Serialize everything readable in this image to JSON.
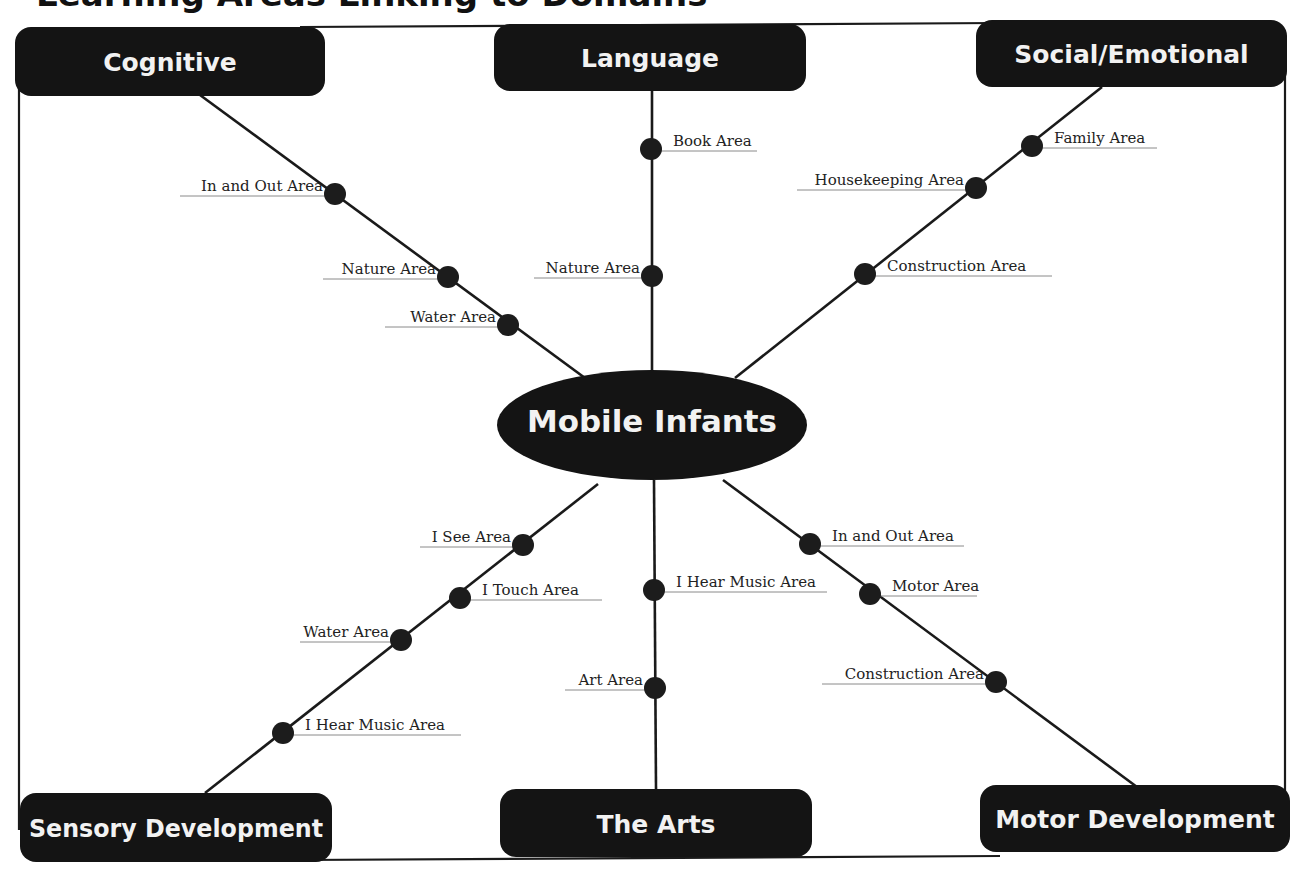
{
  "title_cut_off": "Learning Areas Linking to Domains",
  "hub": {
    "label": "Mobile Infants",
    "cx": 652,
    "cy": 425,
    "rx": 155,
    "ry": 55
  },
  "colors": {
    "box_fill": "#141414",
    "box_text": "#f2f2f2",
    "line": "#1a1a1a",
    "dot": "#1c1c1c",
    "leader": "#8a8a8a"
  },
  "domains": [
    {
      "id": "cognitive",
      "label": "Cognitive",
      "box": [
        15,
        27,
        310,
        69
      ],
      "spoke": [
        [
          200,
          95
        ],
        [
          585,
          378
        ]
      ],
      "areas": [
        {
          "label": "In and Out Area",
          "dot": [
            335,
            194
          ],
          "side": "left",
          "leader_x": 180
        },
        {
          "label": "Nature Area",
          "dot": [
            448,
            277
          ],
          "side": "left",
          "leader_x": 323
        },
        {
          "label": "Water Area",
          "dot": [
            508,
            325
          ],
          "side": "left",
          "leader_x": 385
        }
      ]
    },
    {
      "id": "language",
      "label": "Language",
      "box": [
        494,
        24,
        312,
        67
      ],
      "spoke": [
        [
          652,
          91
        ],
        [
          652,
          371
        ]
      ],
      "areas": [
        {
          "label": "Book Area",
          "dot": [
            651,
            149
          ],
          "side": "right",
          "leader_x": 757
        },
        {
          "label": "Nature Area",
          "dot": [
            652,
            276
          ],
          "side": "left",
          "leader_x": 534
        }
      ]
    },
    {
      "id": "social",
      "label": "Social/Emotional",
      "box": [
        976,
        20,
        311,
        67
      ],
      "spoke": [
        [
          1102,
          87
        ],
        [
          735,
          378
        ]
      ],
      "areas": [
        {
          "label": "Family Area",
          "dot": [
            1032,
            146
          ],
          "side": "right",
          "leader_x": 1157
        },
        {
          "label": "Housekeeping Area",
          "dot": [
            976,
            188
          ],
          "side": "left",
          "leader_x": 797
        },
        {
          "label": "Construction Area",
          "dot": [
            865,
            274
          ],
          "side": "right",
          "leader_x": 1052
        }
      ]
    },
    {
      "id": "sensory",
      "label": "Sensory Development",
      "box": [
        20,
        793,
        312,
        69
      ],
      "spoke": [
        [
          598,
          484
        ],
        [
          205,
          793
        ]
      ],
      "areas": [
        {
          "label": "I See Area",
          "dot": [
            523,
            545
          ],
          "side": "left",
          "leader_x": 420
        },
        {
          "label": "I Touch Area",
          "dot": [
            460,
            598
          ],
          "side": "right",
          "leader_x": 602
        },
        {
          "label": "Water Area",
          "dot": [
            401,
            640
          ],
          "side": "left",
          "leader_x": 300
        },
        {
          "label": "I Hear Music Area",
          "dot": [
            283,
            733
          ],
          "side": "right",
          "leader_x": 461
        }
      ]
    },
    {
      "id": "arts",
      "label": "The Arts",
      "box": [
        500,
        789,
        312,
        68
      ],
      "spoke": [
        [
          654,
          480
        ],
        [
          656,
          789
        ]
      ],
      "areas": [
        {
          "label": "I Hear Music Area",
          "dot": [
            654,
            590
          ],
          "side": "right",
          "leader_x": 827
        },
        {
          "label": "Art Area",
          "dot": [
            655,
            688
          ],
          "side": "left",
          "leader_x": 565
        }
      ]
    },
    {
      "id": "motor",
      "label": "Motor Development",
      "box": [
        980,
        785,
        310,
        67
      ],
      "spoke": [
        [
          723,
          480
        ],
        [
          1137,
          787
        ]
      ],
      "areas": [
        {
          "label": "In and Out Area",
          "dot": [
            810,
            544
          ],
          "side": "right",
          "leader_x": 964
        },
        {
          "label": "Motor Area",
          "dot": [
            870,
            594
          ],
          "side": "right",
          "leader_x": 977
        },
        {
          "label": "Construction Area",
          "dot": [
            996,
            682
          ],
          "side": "left",
          "leader_x": 822
        }
      ]
    }
  ],
  "frame": {
    "left": 19,
    "right": 1285,
    "top": 23,
    "bottom": 860
  }
}
